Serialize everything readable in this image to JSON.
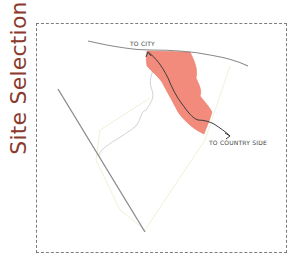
{
  "title": "Site Selection",
  "labels": {
    "to_city": "TO CITY",
    "to_country_side": "TO COUNTRY SIDE"
  },
  "colors": {
    "title": "#8a3a2e",
    "site_fill": "#f28b7c",
    "road": "#8a8a8a",
    "path": "#3c3c3c",
    "boundary": "#eef2d8",
    "contour": "#c0c8cc",
    "frame": "#7d7d7d"
  }
}
